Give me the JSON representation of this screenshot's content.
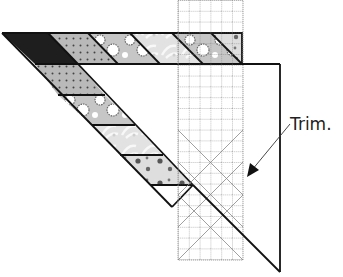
{
  "diagram": {
    "type": "quilting-instruction",
    "annotation": {
      "text": "Trim.",
      "arrow_target": "ruler-right-edge"
    },
    "fabric_patches": [
      {
        "pattern": "solid-dark",
        "color": "#1e1e1e"
      },
      {
        "pattern": "dotted",
        "color": "#b8b8b8"
      },
      {
        "pattern": "circles",
        "color": "#c4c4c4"
      },
      {
        "pattern": "leafy-light",
        "color": "#e4e4e4"
      },
      {
        "pattern": "spotted",
        "color": "#dcdcdc"
      }
    ],
    "ruler": {
      "columns": 6,
      "rows": 24,
      "has_45_degree_lines": true
    },
    "colors": {
      "line": "#111111",
      "grid": "#777777",
      "background": "#ffffff"
    }
  }
}
